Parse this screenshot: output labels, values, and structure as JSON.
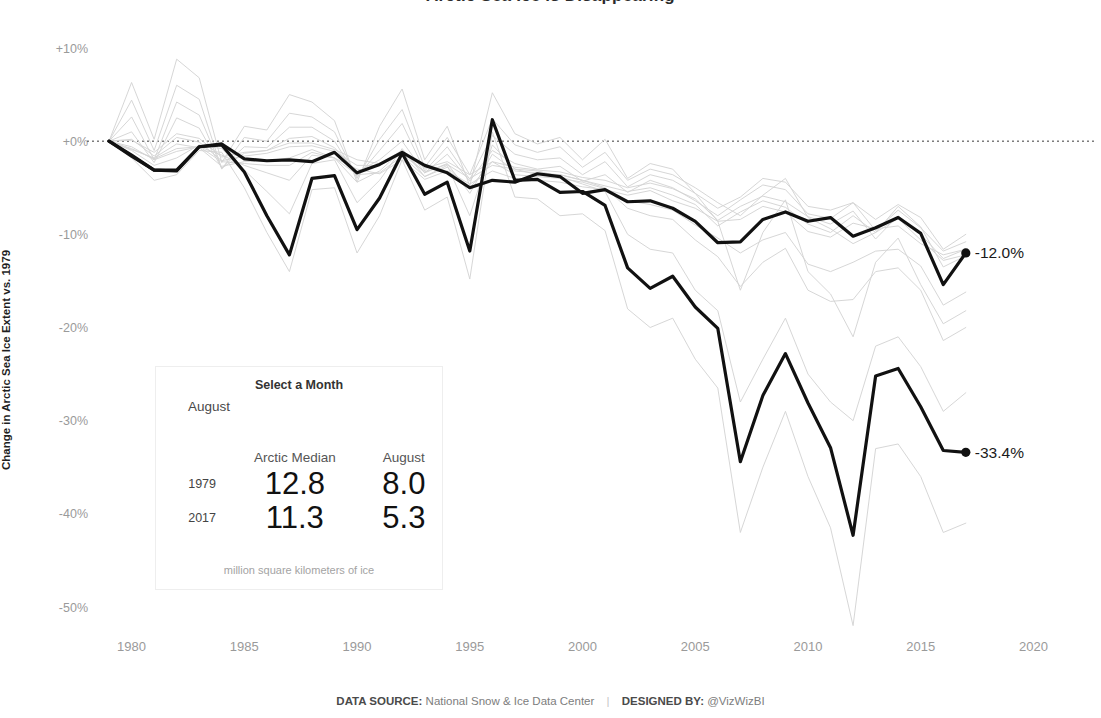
{
  "title": "Arctic Sea Ice is Disappearing",
  "axes": {
    "ylabel": "Change in Arctic Sea Ice Extent vs. 1979",
    "yticks": [
      "+10%",
      "+0%",
      "-10%",
      "-20%",
      "-30%",
      "-40%",
      "-50%"
    ],
    "ytick_values": [
      10,
      0,
      -10,
      -20,
      -30,
      -40,
      -50
    ],
    "xticks": [
      "1980",
      "1985",
      "1990",
      "1995",
      "2000",
      "2005",
      "2010",
      "2015",
      "2020"
    ],
    "xtick_values": [
      1980,
      1985,
      1990,
      1995,
      2000,
      2005,
      2010,
      2015,
      2020
    ],
    "xlim": [
      1978.2,
      2021.0
    ],
    "ylim": [
      -53.0,
      12.5
    ]
  },
  "panel": {
    "header": "Select a Month",
    "selected_month": "August",
    "columns": [
      "Arctic Median",
      "August"
    ],
    "rows": [
      {
        "year": "1979",
        "median": "12.8",
        "month": "8.0"
      },
      {
        "year": "2017",
        "median": "11.3",
        "month": "5.3"
      }
    ],
    "footnote": "million square kilometers of ice"
  },
  "annotations": [
    {
      "name": "median-end-label",
      "text": "-12.0%",
      "x": 2017,
      "y": -12.0
    },
    {
      "name": "august-end-label",
      "text": "-33.4%",
      "x": 2017,
      "y": -33.4
    }
  ],
  "footer": {
    "source_label": "DATA SOURCE:",
    "source_value": "National Snow & Ice Data Center",
    "separator": "|",
    "designer_label": "DESIGNED BY:",
    "designer_value": "@VizWizBI"
  },
  "colors": {
    "highlight": "#111111",
    "background_line": "#d4d4d4",
    "zero_line": "#3a3a3a",
    "tick_text": "#9a9a9a",
    "panel_border": "#eeeeee"
  },
  "chart_data": {
    "type": "line",
    "title": "Arctic Sea Ice is Disappearing",
    "xlabel": "",
    "ylabel": "Change in Arctic Sea Ice Extent vs. 1979",
    "xlim": [
      1978.2,
      2021.0
    ],
    "ylim": [
      -53.0,
      12.5
    ],
    "grid": false,
    "legend": "none",
    "zero_reference_line": 0,
    "x": [
      1979,
      1980,
      1981,
      1982,
      1983,
      1984,
      1985,
      1986,
      1987,
      1988,
      1989,
      1990,
      1991,
      1992,
      1993,
      1994,
      1995,
      1996,
      1997,
      1998,
      1999,
      2000,
      2001,
      2002,
      2003,
      2004,
      2005,
      2006,
      2007,
      2008,
      2009,
      2010,
      2011,
      2012,
      2013,
      2014,
      2015,
      2016,
      2017
    ],
    "series": [
      {
        "name": "Arctic Median",
        "role": "highlight",
        "color": "#111111",
        "end_label": "-12.0%",
        "values": [
          0.0,
          -1.5,
          -3.1,
          -3.1,
          -0.6,
          -0.3,
          -1.9,
          -2.1,
          -2.0,
          -2.2,
          -1.2,
          -3.4,
          -2.5,
          -1.2,
          -2.6,
          -3.4,
          -5.0,
          -4.2,
          -4.4,
          -3.5,
          -3.8,
          -5.6,
          -5.2,
          -6.5,
          -6.4,
          -7.2,
          -8.6,
          -10.9,
          -10.8,
          -8.4,
          -7.6,
          -8.6,
          -8.2,
          -10.2,
          -9.3,
          -8.2,
          -9.9,
          -15.4,
          -12.0
        ]
      },
      {
        "name": "August",
        "role": "highlight",
        "color": "#111111",
        "end_label": "-33.4%",
        "values": [
          0.0,
          -1.6,
          -3.1,
          -3.2,
          -0.6,
          -0.4,
          -3.3,
          -8.0,
          -12.2,
          -4.0,
          -3.7,
          -9.5,
          -6.1,
          -1.3,
          -5.7,
          -4.4,
          -11.8,
          2.3,
          -4.2,
          -4.1,
          -5.5,
          -5.4,
          -6.9,
          -13.6,
          -15.8,
          -14.5,
          -17.8,
          -20.1,
          -34.4,
          -27.3,
          -22.8,
          -28.1,
          -32.9,
          -42.3,
          -25.2,
          -24.4,
          -28.5,
          -33.2,
          -33.4
        ]
      },
      {
        "name": "January",
        "role": "background",
        "color": "#d4d4d4",
        "values": [
          0.0,
          -0.9,
          -1.8,
          -0.3,
          -0.7,
          -2.7,
          -2.2,
          -2.1,
          -1.8,
          -0.9,
          -1.8,
          -3.0,
          -3.5,
          -2.0,
          -4.1,
          -3.2,
          -4.6,
          -3.2,
          -4.0,
          -4.2,
          -4.4,
          -4.9,
          -5.2,
          -5.8,
          -5.3,
          -6.4,
          -7.2,
          -8.6,
          -8.4,
          -7.0,
          -7.6,
          -9.7,
          -10.3,
          -8.8,
          -9.4,
          -9.1,
          -11.0,
          -12.2,
          -11.6
        ]
      },
      {
        "name": "February",
        "role": "background",
        "color": "#d4d4d4",
        "values": [
          0.0,
          0.2,
          -1.6,
          0.4,
          -0.1,
          -2.1,
          -1.6,
          -1.3,
          -0.6,
          -0.5,
          -1.1,
          -2.6,
          -2.6,
          -1.4,
          -3.3,
          -2.5,
          -4.0,
          -2.6,
          -3.0,
          -3.6,
          -3.6,
          -4.2,
          -4.8,
          -5.4,
          -5.0,
          -5.8,
          -6.8,
          -9.1,
          -7.6,
          -6.4,
          -7.1,
          -8.9,
          -9.8,
          -8.0,
          -9.8,
          -8.3,
          -10.6,
          -12.8,
          -12.2
        ]
      },
      {
        "name": "March",
        "role": "background",
        "color": "#d4d4d4",
        "values": [
          0.0,
          0.1,
          -1.2,
          0.8,
          0.3,
          -1.7,
          -1.2,
          -1.0,
          -0.2,
          -0.2,
          -0.9,
          -2.0,
          -2.4,
          -1.0,
          -2.9,
          -2.2,
          -3.6,
          -2.2,
          -2.8,
          -3.1,
          -3.3,
          -3.9,
          -4.2,
          -5.0,
          -4.5,
          -5.1,
          -6.2,
          -8.5,
          -7.0,
          -5.9,
          -6.5,
          -8.1,
          -8.9,
          -7.5,
          -10.5,
          -8.0,
          -10.0,
          -12.6,
          -11.6
        ]
      },
      {
        "name": "April",
        "role": "background",
        "color": "#d4d4d4",
        "values": [
          0.0,
          1.0,
          -2.3,
          2.5,
          1.4,
          -2.9,
          -1.3,
          -1.0,
          0.3,
          0.5,
          -0.7,
          -3.3,
          -2.0,
          0.0,
          -3.4,
          -1.4,
          -4.3,
          -1.0,
          -2.4,
          -3.0,
          -2.7,
          -4.3,
          -3.6,
          -5.5,
          -4.2,
          -5.0,
          -6.4,
          -8.0,
          -6.3,
          -4.7,
          -5.2,
          -7.8,
          -8.3,
          -6.6,
          -9.6,
          -7.4,
          -9.3,
          -11.8,
          -10.8
        ]
      },
      {
        "name": "May",
        "role": "background",
        "color": "#d4d4d4",
        "values": [
          0.0,
          2.6,
          -2.0,
          4.2,
          2.8,
          -2.9,
          -0.6,
          -0.7,
          1.5,
          1.5,
          0.0,
          -3.8,
          -1.0,
          1.9,
          -3.2,
          -0.6,
          -4.1,
          0.6,
          -1.4,
          -2.0,
          -1.8,
          -3.6,
          -2.2,
          -4.9,
          -3.6,
          -4.2,
          -5.6,
          -7.2,
          -6.0,
          -4.0,
          -4.4,
          -7.0,
          -7.4,
          -6.6,
          -8.4,
          -6.8,
          -8.2,
          -11.6,
          -10.0
        ]
      },
      {
        "name": "June",
        "role": "background",
        "color": "#d4d4d4",
        "values": [
          0.0,
          4.4,
          -1.0,
          6.0,
          4.5,
          -3.0,
          0.4,
          0.0,
          3.0,
          2.6,
          1.0,
          -4.0,
          0.2,
          3.4,
          -2.8,
          0.4,
          -3.6,
          2.4,
          -0.4,
          -1.2,
          -0.6,
          -2.8,
          -1.2,
          -4.2,
          -3.0,
          -3.6,
          -5.0,
          -6.6,
          -8.0,
          -5.8,
          -4.0,
          -8.2,
          -9.4,
          -11.0,
          -9.8,
          -7.0,
          -9.2,
          -13.5,
          -12.3
        ]
      },
      {
        "name": "July",
        "role": "background",
        "color": "#d4d4d4",
        "values": [
          0.0,
          6.3,
          0.2,
          8.8,
          6.8,
          -2.3,
          1.6,
          1.2,
          5.0,
          4.2,
          2.2,
          -4.4,
          1.6,
          5.6,
          -2.0,
          1.6,
          -4.8,
          5.2,
          0.8,
          -0.3,
          0.4,
          -2.0,
          0.2,
          -4.0,
          -2.4,
          -3.0,
          -5.6,
          -8.6,
          -16.0,
          -9.8,
          -6.3,
          -14.0,
          -16.4,
          -21.0,
          -13.0,
          -10.4,
          -15.4,
          -19.6,
          -18.2
        ]
      },
      {
        "name": "September",
        "role": "background",
        "color": "#d4d4d4",
        "values": [
          0.0,
          -1.8,
          -4.2,
          -3.6,
          -1.0,
          -1.2,
          -5.0,
          -9.8,
          -14.0,
          -5.2,
          -5.0,
          -12.0,
          -8.0,
          -2.0,
          -7.4,
          -6.0,
          -14.8,
          1.0,
          -6.0,
          -6.2,
          -8.0,
          -7.8,
          -9.6,
          -18.0,
          -20.0,
          -19.0,
          -23.4,
          -26.5,
          -42.0,
          -35.0,
          -29.0,
          -36.0,
          -41.5,
          -52.0,
          -33.0,
          -32.5,
          -36.0,
          -42.0,
          -41.0
        ]
      },
      {
        "name": "October",
        "role": "background",
        "color": "#d4d4d4",
        "values": [
          0.0,
          -1.0,
          -2.6,
          -1.8,
          -0.4,
          -0.8,
          -3.1,
          -5.4,
          -7.8,
          -2.4,
          -2.0,
          -6.6,
          -4.2,
          -0.8,
          -3.8,
          -2.6,
          -8.0,
          -0.4,
          -3.0,
          -3.2,
          -3.8,
          -4.6,
          -5.4,
          -10.0,
          -11.6,
          -12.0,
          -16.0,
          -18.2,
          -28.0,
          -23.4,
          -19.0,
          -25.0,
          -28.0,
          -30.0,
          -22.0,
          -21.0,
          -24.2,
          -29.0,
          -27.0
        ]
      },
      {
        "name": "November",
        "role": "background",
        "color": "#d4d4d4",
        "values": [
          0.0,
          -0.6,
          -2.0,
          -1.1,
          -0.6,
          -1.5,
          -2.6,
          -3.4,
          -4.2,
          -1.5,
          -1.8,
          -4.4,
          -3.2,
          -1.0,
          -3.4,
          -2.4,
          -5.6,
          -1.4,
          -3.2,
          -3.4,
          -3.6,
          -4.2,
          -5.0,
          -7.2,
          -8.0,
          -8.4,
          -10.6,
          -12.4,
          -15.6,
          -13.0,
          -11.5,
          -16.0,
          -17.2,
          -17.0,
          -14.0,
          -13.6,
          -16.0,
          -21.4,
          -20.0
        ]
      },
      {
        "name": "December",
        "role": "background",
        "color": "#d4d4d4",
        "values": [
          0.0,
          -0.8,
          -1.9,
          -0.8,
          -0.6,
          -2.2,
          -2.4,
          -2.6,
          -2.6,
          -1.2,
          -1.8,
          -3.6,
          -3.4,
          -1.6,
          -3.8,
          -2.8,
          -5.0,
          -2.2,
          -3.6,
          -3.8,
          -4.0,
          -4.4,
          -5.1,
          -6.4,
          -6.8,
          -7.4,
          -9.0,
          -10.4,
          -12.0,
          -10.6,
          -9.8,
          -13.2,
          -14.0,
          -13.0,
          -11.8,
          -11.6,
          -13.4,
          -17.6,
          -16.2
        ]
      }
    ]
  }
}
